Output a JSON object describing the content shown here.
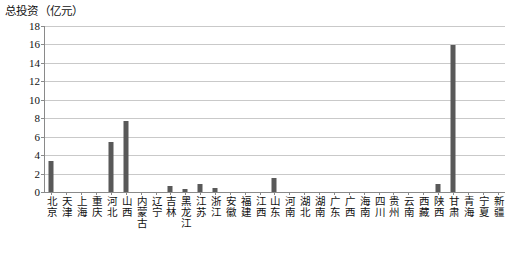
{
  "chart_data": {
    "type": "bar",
    "title": "总投资（亿元）",
    "xlabel": "",
    "ylabel": "",
    "ylim": [
      0,
      18
    ],
    "yticks": [
      0,
      2,
      4,
      6,
      8,
      10,
      12,
      14,
      16,
      18
    ],
    "grid": true,
    "legend": null,
    "bar_color": "#595959",
    "gridline_color": "#c9c9c9",
    "axis_color": "#8a8a8a",
    "categories": [
      "北京",
      "天津",
      "上海",
      "重庆",
      "河北",
      "山西",
      "内蒙古",
      "辽宁",
      "吉林",
      "黑龙江",
      "江苏",
      "浙江",
      "安徽",
      "福建",
      "江西",
      "山东",
      "河南",
      "湖北",
      "湖南",
      "广东",
      "广西",
      "海南",
      "四川",
      "贵州",
      "云南",
      "西藏",
      "陕西",
      "甘肃",
      "青海",
      "宁夏",
      "新疆"
    ],
    "values": [
      3.4,
      0,
      0,
      0,
      5.4,
      7.7,
      0,
      0,
      0.6,
      0.3,
      0.9,
      0.4,
      0,
      0,
      0,
      1.5,
      0,
      0,
      0,
      0,
      0,
      0,
      0,
      0,
      0,
      0,
      0.9,
      15.9,
      0,
      0,
      0
    ]
  }
}
